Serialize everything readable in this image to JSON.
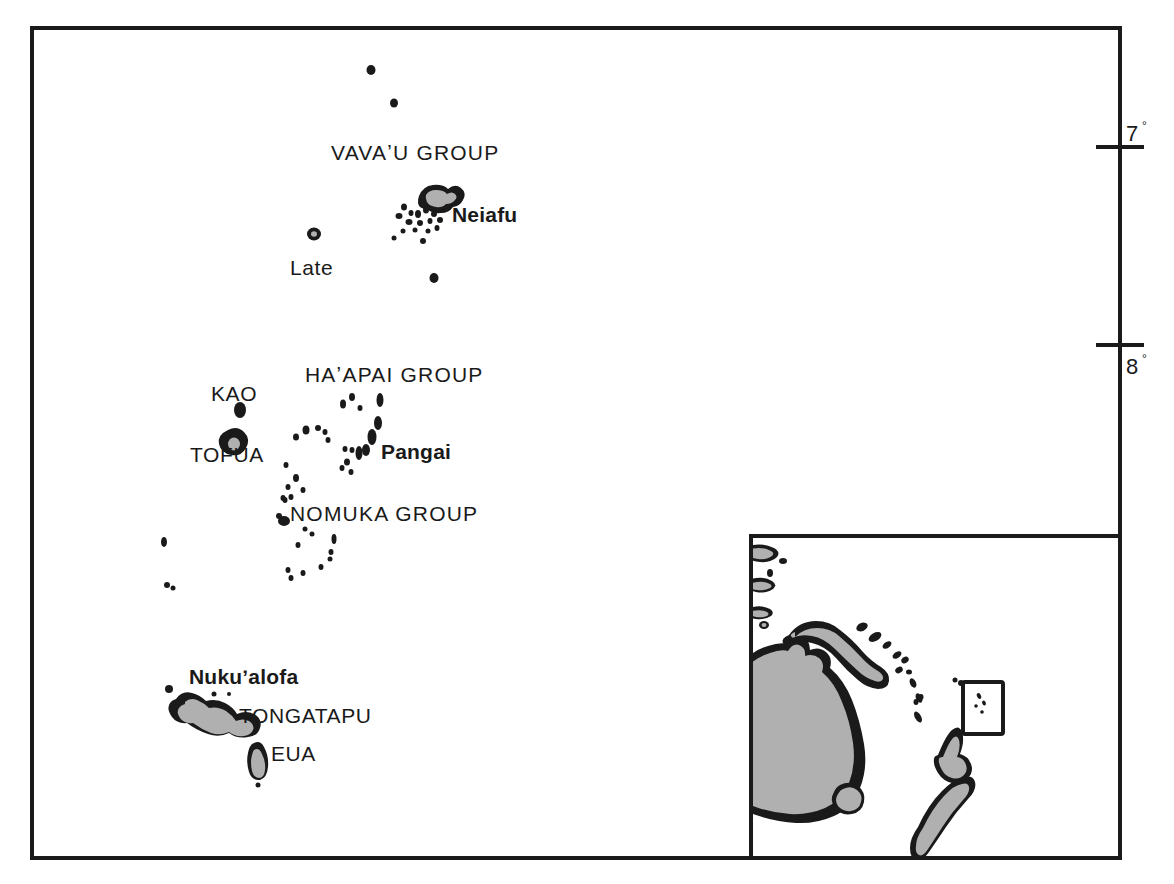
{
  "figure": {
    "type": "reference-map",
    "background_color": "#ffffff",
    "ink_color": "#1a1a1a",
    "land_fill_color": "#b0b0b0"
  },
  "main_map": {
    "frame": {
      "x": 32,
      "y": 28,
      "width": 1088,
      "height": 830
    },
    "graticule": {
      "axis": "latitude",
      "side": "right",
      "ticks": [
        {
          "label": "7",
          "degree_symbol": "°",
          "y": 147
        },
        {
          "label": "8",
          "degree_symbol": "°",
          "y": 345
        }
      ]
    },
    "labels": [
      {
        "name": "vavau-group",
        "text": "VAVAʼU  GROUP",
        "kind": "group",
        "x": 331,
        "y": 160
      },
      {
        "name": "neiafu",
        "text": "Neiafu",
        "kind": "city",
        "x": 452,
        "y": 222
      },
      {
        "name": "late",
        "text": "Late",
        "kind": "island",
        "x": 290,
        "y": 275
      },
      {
        "name": "haapai-group",
        "text": "HAʼAPAI  GROUP",
        "kind": "group",
        "x": 305,
        "y": 382
      },
      {
        "name": "kao",
        "text": "KAO",
        "kind": "island",
        "x": 211,
        "y": 401
      },
      {
        "name": "tofua",
        "text": "TOFUA",
        "kind": "island",
        "x": 190,
        "y": 462
      },
      {
        "name": "pangai",
        "text": "Pangai",
        "kind": "city",
        "x": 381,
        "y": 459
      },
      {
        "name": "nomuka-group",
        "text": "NOMUKA  GROUP",
        "kind": "group",
        "x": 290,
        "y": 521
      },
      {
        "name": "nukualofa",
        "text": "Nukuʼalofa",
        "kind": "city",
        "x": 189,
        "y": 684
      },
      {
        "name": "tongatapu",
        "text": "TONGATAPU",
        "kind": "island",
        "x": 239,
        "y": 723
      },
      {
        "name": "eua",
        "text": "EUA",
        "kind": "island",
        "x": 271,
        "y": 761
      }
    ]
  },
  "inset_map": {
    "name": "locator-inset",
    "frame": {
      "x": 751,
      "y": 536,
      "width": 369,
      "height": 322
    },
    "landmasses": [
      "Australia",
      "New Guinea",
      "New Zealand",
      "Tasmania",
      "Melanesian islands"
    ],
    "locator_box": {
      "x": 963,
      "y": 682,
      "width": 40,
      "height": 52,
      "marks": "Tonga islands"
    }
  }
}
